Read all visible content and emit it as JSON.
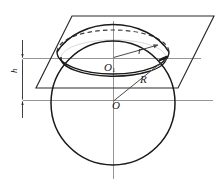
{
  "figure": {
    "kind": "geometry-diagram",
    "width": 224,
    "height": 191,
    "background_color": "#ffffff",
    "stroke_color": "#1a1a1a",
    "thin_stroke_color": "#7a7a7a",
    "labels": {
      "radius_small": "r",
      "radius_large": "R",
      "center_small_circle": "O",
      "center_small_circle_subscript": "1",
      "center_sphere": "O",
      "height": "h"
    },
    "elements": [
      {
        "name": "sphere-outline",
        "type": "circle",
        "cx": 113,
        "cy": 103,
        "r": 62
      },
      {
        "name": "cutting-plane",
        "type": "parallelogram",
        "points": "72,16 214,16 178,88 36,88"
      },
      {
        "name": "section-ellipse",
        "type": "ellipse",
        "cx": 113,
        "cy": 52,
        "rx": 56,
        "ry": 22
      },
      {
        "name": "small-circle-ellipse",
        "type": "ellipse",
        "cx": 113,
        "cy": 57,
        "rx": 52,
        "ry": 17
      },
      {
        "name": "radius-small-arrow",
        "type": "arrow",
        "from": "113,57",
        "to": "158,45"
      },
      {
        "name": "radius-large-arrow",
        "type": "arrow",
        "from": "113,103",
        "to": "166,58"
      },
      {
        "name": "vertical-axis",
        "type": "line",
        "from": "113,22",
        "to": "113,178"
      },
      {
        "name": "horizontal-axis-top",
        "type": "line",
        "from": "22,58",
        "to": "200,58"
      },
      {
        "name": "horizontal-axis-bottom",
        "type": "line",
        "from": "22,100",
        "to": "212,100"
      },
      {
        "name": "dimension-line-h",
        "type": "line",
        "from": "22,40",
        "to": "22,118"
      },
      {
        "name": "dimension-arrow-top",
        "type": "arrowhead",
        "at": "22,58",
        "direction": "down"
      },
      {
        "name": "dimension-arrow-bottom",
        "type": "arrowhead",
        "at": "22,100",
        "direction": "up"
      }
    ]
  }
}
